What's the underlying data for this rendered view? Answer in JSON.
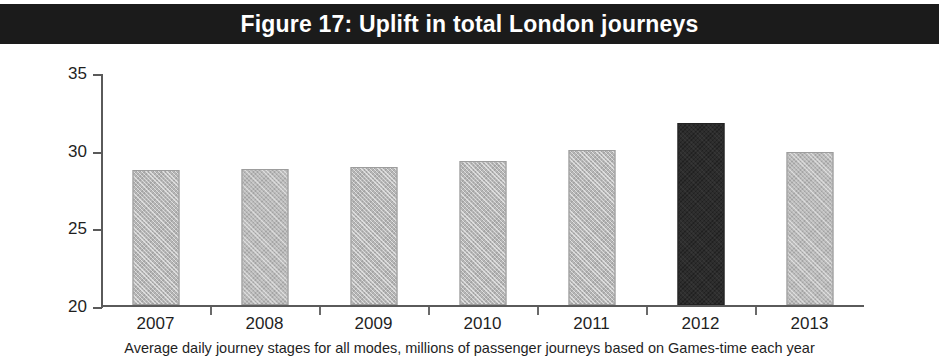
{
  "figure": {
    "title": "Figure 17: Uplift in total London journeys",
    "caption": "Average daily journey stages for all modes, millions of passenger journeys based on Games-time each year",
    "title_band_color": "#1b1b1b",
    "title_text_color": "#ffffff",
    "bar_color": "#b6b6b6",
    "highlight_bar_color": "#2b2b2b",
    "axis_color": "#5a5a5a"
  },
  "chart_data": {
    "type": "bar",
    "title": "Figure 17: Uplift in total London journeys",
    "subtitle": "Average daily journey stages for all modes, millions of passenger journeys based on Games-time each year",
    "xlabel": "",
    "ylabel": "",
    "categories": [
      "2007",
      "2008",
      "2009",
      "2010",
      "2011",
      "2012",
      "2013"
    ],
    "values": [
      28.7,
      28.8,
      28.9,
      29.3,
      30.0,
      31.8,
      29.9
    ],
    "highlight_index": 5,
    "ylim": [
      20,
      35
    ],
    "yticks": [
      20,
      25,
      30,
      35
    ],
    "ytick_labels": [
      "20",
      "25",
      "30",
      "35"
    ],
    "grid": false,
    "legend": null
  }
}
